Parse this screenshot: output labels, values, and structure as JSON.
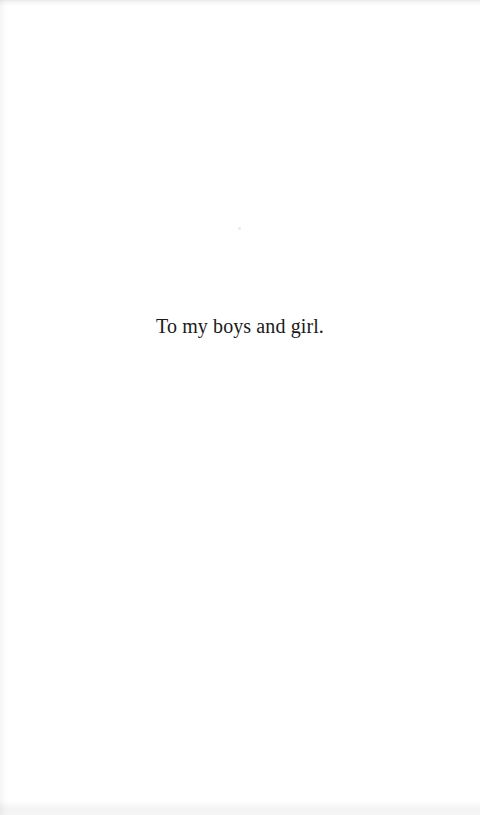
{
  "page": {
    "name": "dedication-page",
    "background_color": "#ffffff",
    "width": 480,
    "height": 815
  },
  "dedication": {
    "text": "To my boys and girl.",
    "ink_color": "#1a1a1a",
    "alignment": "center"
  },
  "artifacts": {
    "top_edge": "scan-smudge-top",
    "bottom_edge": "scan-smudge-bottom",
    "left_edge": "scan-gutter-shading-left",
    "speck": "dust-speck"
  }
}
